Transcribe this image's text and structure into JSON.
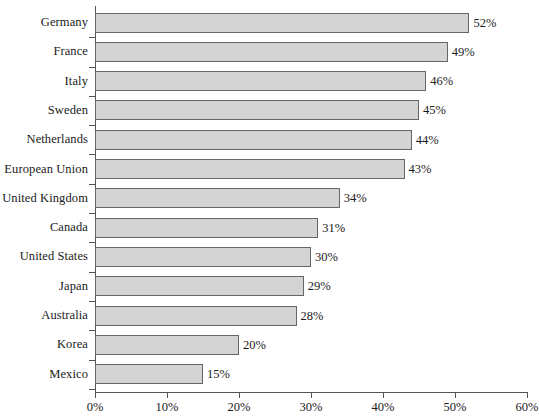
{
  "chart_data": {
    "type": "bar",
    "orientation": "horizontal",
    "title": "",
    "subtitle": "",
    "xlabel": "",
    "ylabel": "",
    "xlim": [
      0,
      60
    ],
    "xticks": [
      0,
      10,
      20,
      30,
      40,
      50,
      60
    ],
    "xtick_labels": [
      "0%",
      "10%",
      "20%",
      "30%",
      "40%",
      "50%",
      "60%"
    ],
    "grid": false,
    "legend": null,
    "value_suffix": "%",
    "categories": [
      "Germany",
      "France",
      "Italy",
      "Sweden",
      "Netherlands",
      "European Union",
      "United Kingdom",
      "Canada",
      "United States",
      "Japan",
      "Australia",
      "Korea",
      "Mexico"
    ],
    "values": [
      52,
      49,
      46,
      45,
      44,
      43,
      34,
      31,
      30,
      29,
      28,
      20,
      15
    ],
    "data_labels": [
      "52%",
      "49%",
      "46%",
      "45%",
      "44%",
      "43%",
      "34%",
      "31%",
      "30%",
      "29%",
      "28%",
      "20%",
      "15%"
    ],
    "colors": {
      "bar_fill": "#d4d4d4",
      "bar_border": "#666666",
      "axis": "#555555",
      "text": "#1a1a1a",
      "background": "#ffffff"
    }
  }
}
